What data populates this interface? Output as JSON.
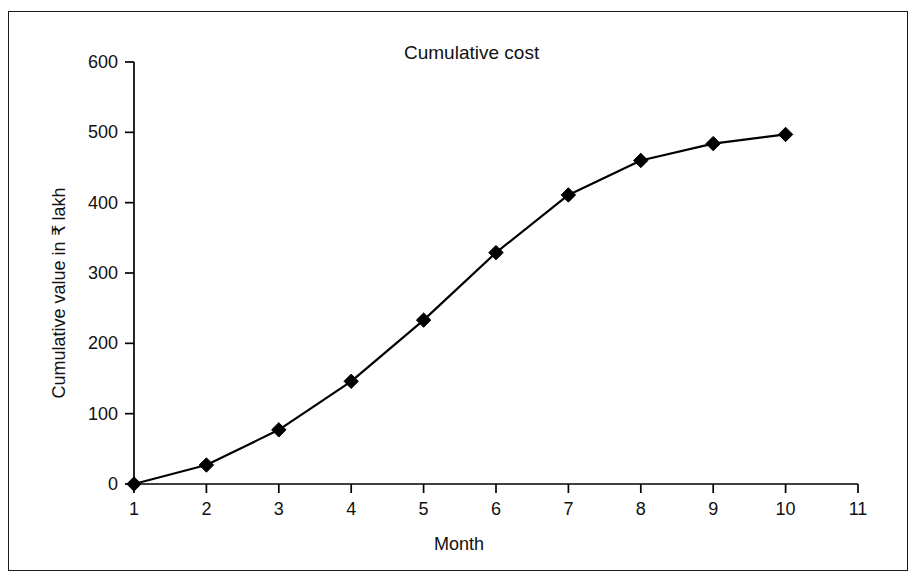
{
  "figure": {
    "background": "#ffffff",
    "border_color": "#1a1a1a",
    "line_color": "#000000",
    "marker_color": "#000000"
  },
  "chart_data": {
    "type": "line",
    "title": "Cumulative cost",
    "xlabel": "Month",
    "ylabel": "Cumulative value in ₹ lakh",
    "x": [
      1,
      2,
      3,
      4,
      5,
      6,
      7,
      8,
      9,
      10
    ],
    "values": [
      0,
      27,
      77,
      146,
      233,
      329,
      411,
      460,
      484,
      497
    ],
    "series": [
      {
        "name": "Cumulative cost",
        "values": [
          0,
          27,
          77,
          146,
          233,
          329,
          411,
          460,
          484,
          497
        ]
      }
    ],
    "xlim": [
      1,
      11
    ],
    "ylim": [
      0,
      600
    ],
    "xticks": [
      1,
      2,
      3,
      4,
      5,
      6,
      7,
      8,
      9,
      10,
      11
    ],
    "xtick_labels": [
      "1",
      "2",
      "3",
      "4",
      "5",
      "6",
      "7",
      "8",
      "9",
      "10",
      "11"
    ],
    "yticks": [
      0,
      100,
      200,
      300,
      400,
      500,
      600
    ],
    "ytick_labels": [
      "0",
      "100",
      "200",
      "300",
      "400",
      "500",
      "600"
    ],
    "grid": false,
    "legend": false,
    "legend_position": "none",
    "marker": "diamond",
    "annotations": []
  }
}
